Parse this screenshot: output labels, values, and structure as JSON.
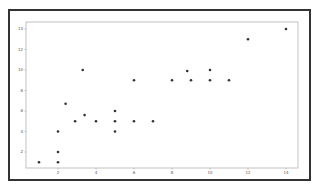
{
  "chart_data": {
    "type": "scatter",
    "title": "",
    "xlabel": "",
    "ylabel": "",
    "xlim": [
      0.5,
      14.6
    ],
    "ylim": [
      0.4,
      14.6
    ],
    "grid": false,
    "legend": null,
    "x_ticks": [
      2,
      4,
      6,
      8,
      10,
      12,
      14
    ],
    "y_ticks": [
      2,
      4,
      6,
      8,
      10,
      12,
      14
    ],
    "marker_color": "#333333",
    "series": [
      {
        "name": "points",
        "points": [
          {
            "x": 1,
            "y": 1
          },
          {
            "x": 2,
            "y": 1
          },
          {
            "x": 2,
            "y": 2
          },
          {
            "x": 2,
            "y": 4
          },
          {
            "x": 2.4,
            "y": 6.7
          },
          {
            "x": 2.9,
            "y": 5
          },
          {
            "x": 3.4,
            "y": 5.6
          },
          {
            "x": 3.3,
            "y": 10
          },
          {
            "x": 4,
            "y": 5
          },
          {
            "x": 5,
            "y": 6
          },
          {
            "x": 5,
            "y": 5
          },
          {
            "x": 5,
            "y": 4
          },
          {
            "x": 6,
            "y": 5
          },
          {
            "x": 6,
            "y": 9
          },
          {
            "x": 7,
            "y": 5
          },
          {
            "x": 8,
            "y": 9
          },
          {
            "x": 8.8,
            "y": 9.9
          },
          {
            "x": 9,
            "y": 9
          },
          {
            "x": 10,
            "y": 10
          },
          {
            "x": 10,
            "y": 9
          },
          {
            "x": 11,
            "y": 9
          },
          {
            "x": 12,
            "y": 13
          },
          {
            "x": 14,
            "y": 14
          }
        ]
      }
    ]
  }
}
